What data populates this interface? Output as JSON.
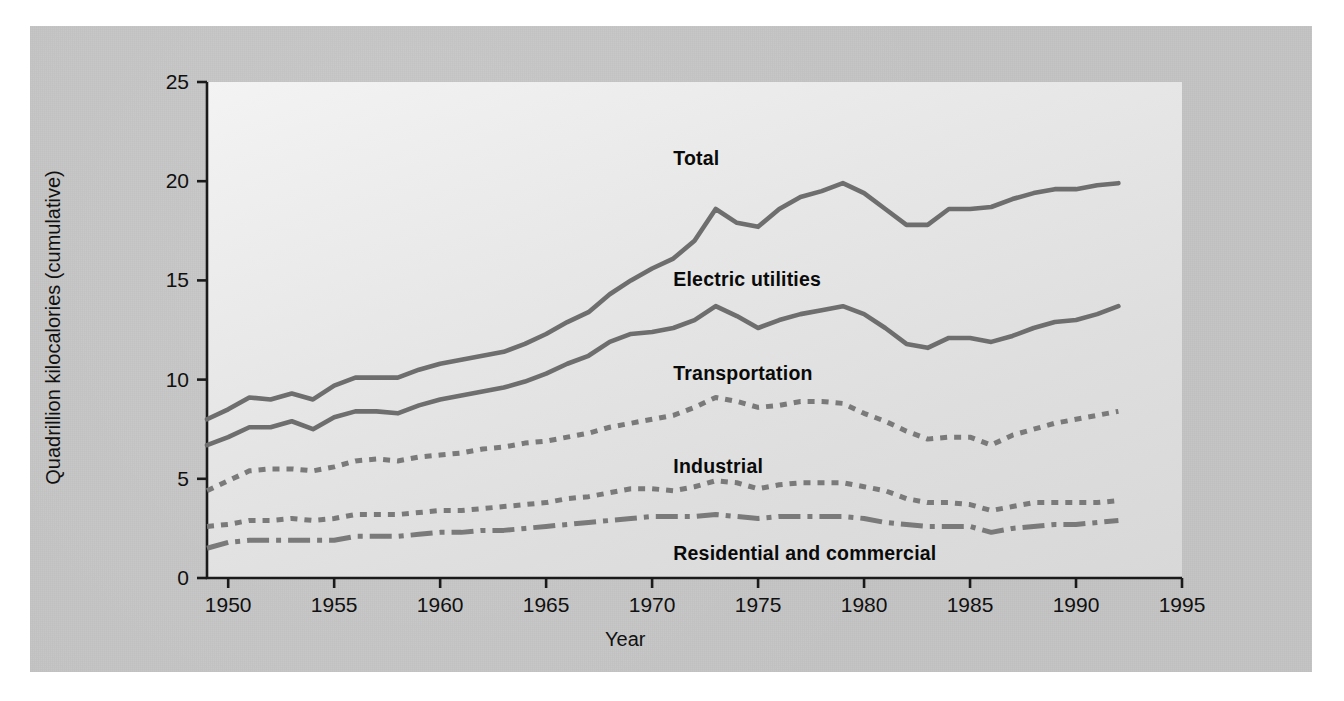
{
  "figure": {
    "background_color": "#c3c3c3",
    "plot_background_color": "#e7e7e7",
    "axis_color": "#1a1a1a",
    "line_color": "#6e6e6e"
  },
  "chart_data": {
    "type": "line",
    "title": "",
    "subtitle": "",
    "xlabel": "Year",
    "ylabel": "Quadrillion kilocalories (cumulative)",
    "xlim": [
      1949,
      1995
    ],
    "ylim": [
      0,
      25
    ],
    "xticks": [
      1950,
      1955,
      1960,
      1965,
      1970,
      1975,
      1980,
      1985,
      1990,
      1995
    ],
    "xtick_labels": [
      "1950",
      "1955",
      "1960",
      "1965",
      "1970",
      "1975",
      "1980",
      "1985",
      "1990",
      "1995"
    ],
    "yticks": [
      0,
      5,
      10,
      15,
      20,
      25
    ],
    "ytick_labels": [
      "0",
      "5",
      "10",
      "15",
      "20",
      "25"
    ],
    "grid": false,
    "legend_position": "inline-annotations",
    "stacked": true,
    "x": [
      1949,
      1950,
      1951,
      1952,
      1953,
      1954,
      1955,
      1956,
      1957,
      1958,
      1959,
      1960,
      1961,
      1962,
      1963,
      1964,
      1965,
      1966,
      1967,
      1968,
      1969,
      1970,
      1971,
      1972,
      1973,
      1974,
      1975,
      1976,
      1977,
      1978,
      1979,
      1980,
      1981,
      1982,
      1983,
      1984,
      1985,
      1986,
      1987,
      1988,
      1989,
      1990,
      1991,
      1992
    ],
    "series": [
      {
        "name": "Total",
        "line_style": "solid",
        "color": "#6e6e6e",
        "label_x": 1971,
        "label_y": 21.1,
        "values": [
          8.0,
          8.5,
          9.1,
          9.0,
          9.3,
          9.0,
          9.7,
          10.1,
          10.1,
          10.1,
          10.5,
          10.8,
          11.0,
          11.2,
          11.4,
          11.8,
          12.3,
          12.9,
          13.4,
          14.3,
          15.0,
          15.6,
          16.1,
          17.0,
          18.6,
          17.9,
          17.7,
          18.6,
          19.2,
          19.5,
          19.9,
          19.4,
          18.6,
          17.8,
          17.8,
          18.6,
          18.6,
          18.7,
          19.1,
          19.4,
          19.6,
          19.6,
          19.8,
          19.9
        ]
      },
      {
        "name": "Electric utilities",
        "line_style": "solid",
        "color": "#6e6e6e",
        "label_x": 1971,
        "label_y": 15.0,
        "values": [
          6.7,
          7.1,
          7.6,
          7.6,
          7.9,
          7.5,
          8.1,
          8.4,
          8.4,
          8.3,
          8.7,
          9.0,
          9.2,
          9.4,
          9.6,
          9.9,
          10.3,
          10.8,
          11.2,
          11.9,
          12.3,
          12.4,
          12.6,
          13.0,
          13.7,
          13.2,
          12.6,
          13.0,
          13.3,
          13.5,
          13.7,
          13.3,
          12.6,
          11.8,
          11.6,
          12.1,
          12.1,
          11.9,
          12.2,
          12.6,
          12.9,
          13.0,
          13.3,
          13.7
        ]
      },
      {
        "name": "Transportation",
        "line_style": "dotted",
        "color": "#7a7a7a",
        "label_x": 1971,
        "label_y": 10.3,
        "values": [
          4.4,
          4.9,
          5.4,
          5.5,
          5.5,
          5.4,
          5.6,
          5.9,
          6.0,
          5.9,
          6.1,
          6.2,
          6.3,
          6.5,
          6.6,
          6.8,
          6.9,
          7.1,
          7.3,
          7.6,
          7.8,
          8.0,
          8.2,
          8.6,
          9.1,
          8.9,
          8.6,
          8.7,
          8.9,
          8.9,
          8.8,
          8.3,
          7.9,
          7.4,
          7.0,
          7.1,
          7.1,
          6.7,
          7.2,
          7.5,
          7.8,
          8.0,
          8.2,
          8.4
        ]
      },
      {
        "name": "Industrial",
        "line_style": "dotted",
        "color": "#7a7a7a",
        "label_x": 1971,
        "label_y": 5.6,
        "values": [
          2.6,
          2.7,
          2.9,
          2.9,
          3.0,
          2.9,
          3.0,
          3.2,
          3.2,
          3.2,
          3.3,
          3.4,
          3.4,
          3.5,
          3.6,
          3.7,
          3.8,
          4.0,
          4.1,
          4.3,
          4.5,
          4.5,
          4.4,
          4.6,
          4.9,
          4.8,
          4.5,
          4.7,
          4.8,
          4.8,
          4.8,
          4.6,
          4.4,
          4.0,
          3.8,
          3.8,
          3.7,
          3.4,
          3.6,
          3.8,
          3.8,
          3.8,
          3.8,
          3.9
        ]
      },
      {
        "name": "Residential and commercial",
        "line_style": "dashdot",
        "color": "#7a7a7a",
        "label_x": 1971,
        "label_y": 1.2,
        "values": [
          1.5,
          1.8,
          1.9,
          1.9,
          1.9,
          1.9,
          1.9,
          2.1,
          2.1,
          2.1,
          2.2,
          2.3,
          2.3,
          2.4,
          2.4,
          2.5,
          2.6,
          2.7,
          2.8,
          2.9,
          3.0,
          3.1,
          3.1,
          3.1,
          3.2,
          3.1,
          3.0,
          3.1,
          3.1,
          3.1,
          3.1,
          3.0,
          2.8,
          2.7,
          2.6,
          2.6,
          2.6,
          2.3,
          2.5,
          2.6,
          2.7,
          2.7,
          2.8,
          2.9
        ]
      }
    ]
  }
}
